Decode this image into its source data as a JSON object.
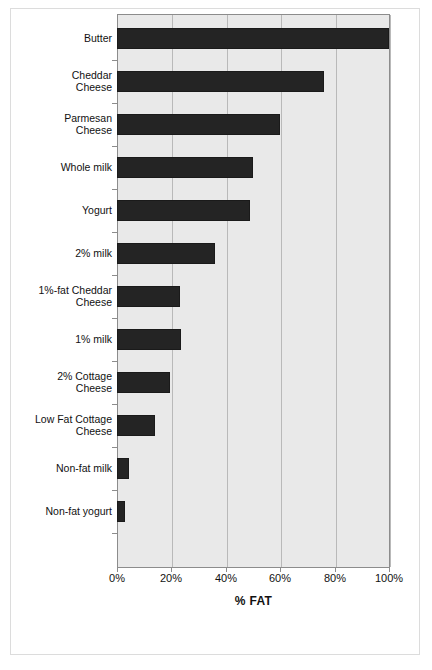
{
  "chart_data": {
    "type": "bar",
    "orientation": "horizontal",
    "title": "",
    "xlabel": "% FAT",
    "ylabel": "",
    "xlim": [
      0,
      100
    ],
    "xticks": [
      0,
      20,
      40,
      60,
      80,
      100
    ],
    "xtick_labels": [
      "0%",
      "20%",
      "40%",
      "60%",
      "80%",
      "100%"
    ],
    "grid": true,
    "grid_axis": "x",
    "legend": false,
    "categories": [
      "Butter",
      "Cheddar\nCheese",
      "Parmesan\nCheese",
      "Whole milk",
      "Yogurt",
      "2% milk",
      "1%-fat Cheddar\nCheese",
      "1% milk",
      "2% Cottage\nCheese",
      "Low Fat Cottage\nCheese",
      "Non-fat milk",
      "Non-fat yogurt"
    ],
    "values": [
      100,
      76,
      60,
      50,
      49,
      36,
      23,
      23.5,
      19.5,
      14,
      4.5,
      3
    ],
    "bar_color": "#242424",
    "plot_background": "#e9e9e9",
    "gridline_color": "#b9b9b9"
  },
  "axis": {
    "x_title": "% FAT",
    "tick_labels": [
      "0%",
      "20%",
      "40%",
      "60%",
      "80%",
      "100%"
    ]
  },
  "categories": [
    {
      "label": "Butter",
      "value": 100
    },
    {
      "label": "Cheddar\nCheese",
      "value": 76
    },
    {
      "label": "Parmesan\nCheese",
      "value": 60
    },
    {
      "label": "Whole milk",
      "value": 50
    },
    {
      "label": "Yogurt",
      "value": 49
    },
    {
      "label": "2% milk",
      "value": 36
    },
    {
      "label": "1%-fat Cheddar\nCheese",
      "value": 23
    },
    {
      "label": "1% milk",
      "value": 23.5
    },
    {
      "label": "2% Cottage\nCheese",
      "value": 19.5
    },
    {
      "label": "Low Fat Cottage\nCheese",
      "value": 14
    },
    {
      "label": "Non-fat milk",
      "value": 4.5
    },
    {
      "label": "Non-fat yogurt",
      "value": 3
    }
  ]
}
